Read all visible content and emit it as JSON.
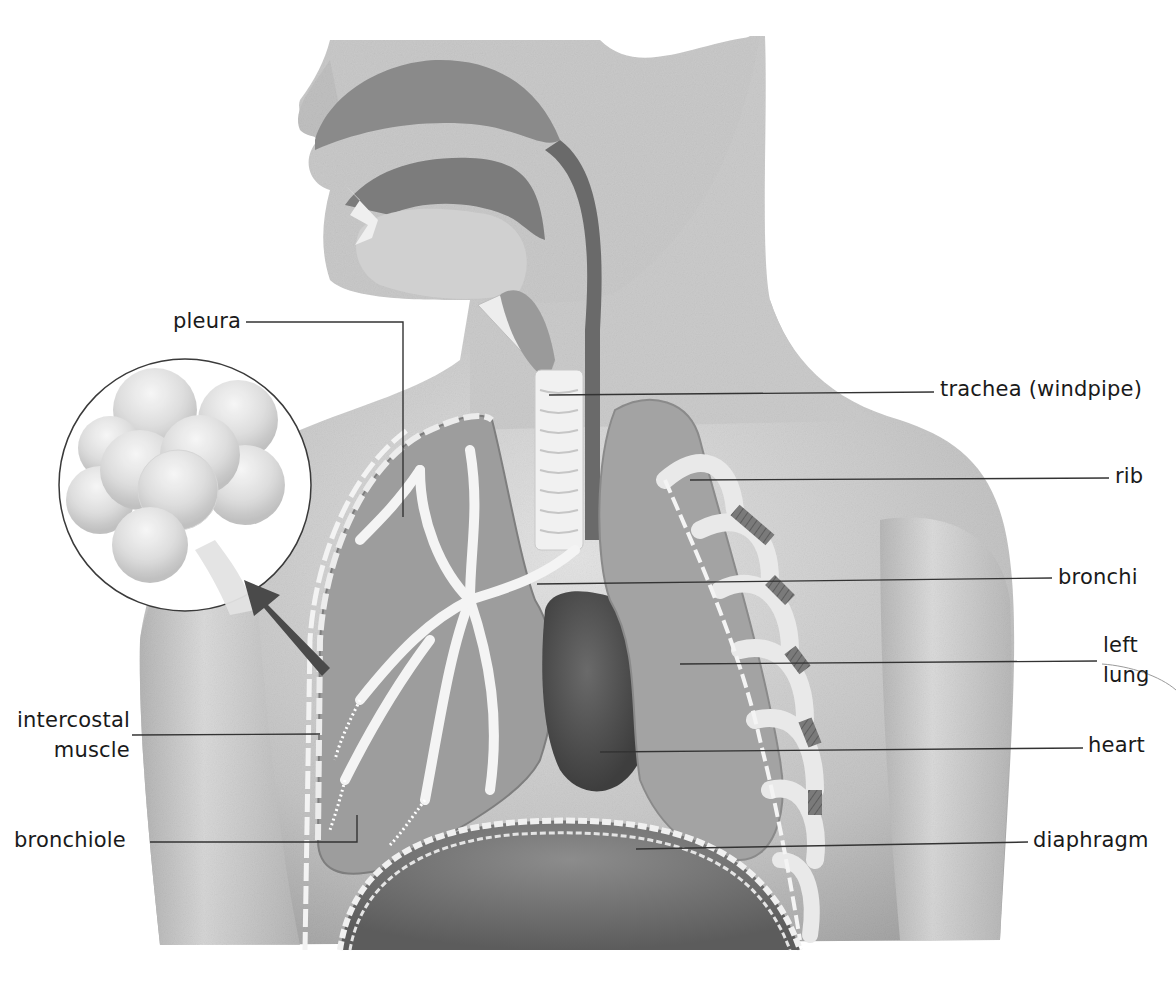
{
  "diagram": {
    "palette": {
      "background": "#ffffff",
      "skin_light": "#d9d9d9",
      "skin_mid": "#bdbdbd",
      "skin_dark": "#9a9a9a",
      "cavity_dark": "#6f6f6f",
      "organ_dark": "#4e4e4e",
      "airway_white": "#f2f2f2",
      "leader_line": "#333333",
      "label_text": "#1a1a1a"
    },
    "inset": {
      "name": "alveoli-magnified-inset",
      "description": "Magnified cluster of alveoli",
      "pointer": "arrow from lung to inset"
    },
    "labels": [
      {
        "id": "pleura",
        "text": "pleura",
        "side": "left"
      },
      {
        "id": "intercostal-muscle",
        "lines": [
          "intercostal",
          "muscle"
        ],
        "side": "left"
      },
      {
        "id": "bronchiole",
        "text": "bronchiole",
        "side": "left"
      },
      {
        "id": "trachea",
        "text": "trachea (windpipe)",
        "side": "right"
      },
      {
        "id": "rib",
        "text": "rib",
        "side": "right"
      },
      {
        "id": "bronchi",
        "text": "bronchi",
        "side": "right"
      },
      {
        "id": "left-lung",
        "lines": [
          "left",
          "lung"
        ],
        "side": "right"
      },
      {
        "id": "heart",
        "text": "heart",
        "side": "right"
      },
      {
        "id": "diaphragm",
        "text": "diaphragm",
        "side": "right"
      }
    ]
  }
}
